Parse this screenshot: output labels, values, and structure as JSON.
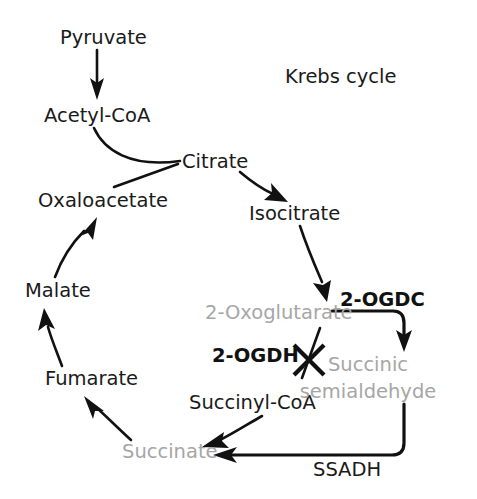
{
  "figure": {
    "title": "Krebs cycle",
    "title_position": {
      "x": 285,
      "y": 77
    },
    "background_color": "#ffffff",
    "colors": {
      "text": "#1a1a1a",
      "muted_text": "#a6a6a6",
      "arrow": "#111111"
    }
  },
  "nodes": [
    {
      "id": "pyruvate",
      "label": "Pyruvate",
      "x": 60,
      "y": 38,
      "style": "normal",
      "anchor": "start"
    },
    {
      "id": "acetyl_coa",
      "label": "Acetyl-CoA",
      "x": 44,
      "y": 116,
      "style": "normal",
      "anchor": "start"
    },
    {
      "id": "citrate",
      "label": "Citrate",
      "x": 182,
      "y": 162,
      "style": "normal",
      "anchor": "start"
    },
    {
      "id": "isocitrate",
      "label": "Isocitrate",
      "x": 249,
      "y": 214,
      "style": "normal",
      "anchor": "start"
    },
    {
      "id": "oxaloacetate",
      "label": "Oxaloacetate",
      "x": 38,
      "y": 201,
      "style": "normal",
      "anchor": "start"
    },
    {
      "id": "malate",
      "label": "Malate",
      "x": 25,
      "y": 291,
      "style": "normal",
      "anchor": "start"
    },
    {
      "id": "fumarate",
      "label": "Fumarate",
      "x": 45,
      "y": 379,
      "style": "normal",
      "anchor": "start"
    },
    {
      "id": "succinate",
      "label": "Succinate",
      "x": 122,
      "y": 452,
      "style": "muted",
      "anchor": "start"
    },
    {
      "id": "succinyl_coa",
      "label": "Succinyl-CoA",
      "x": 189,
      "y": 403,
      "style": "normal",
      "anchor": "start"
    },
    {
      "id": "oxoglutarate",
      "label": "2-Oxoglutarate",
      "x": 205,
      "y": 313,
      "style": "muted",
      "anchor": "start"
    },
    {
      "id": "succinic_1",
      "label": "Succinic",
      "x": 368,
      "y": 365,
      "style": "muted",
      "anchor": "middle"
    },
    {
      "id": "succinic_2",
      "label": "semialdehyde",
      "x": 368,
      "y": 392,
      "style": "muted",
      "anchor": "middle"
    }
  ],
  "enzymes": [
    {
      "id": "ogdc",
      "label": "2-OGDC",
      "x": 340,
      "y": 300,
      "style": "bold",
      "anchor": "start",
      "state": "active"
    },
    {
      "id": "ogdh",
      "label": "2-OGDH",
      "x": 212,
      "y": 356,
      "style": "bold",
      "anchor": "start",
      "state": "blocked"
    },
    {
      "id": "ssadh",
      "label": "SSADH",
      "x": 313,
      "y": 470,
      "style": "plain",
      "anchor": "start",
      "state": "active"
    }
  ],
  "edges": [
    {
      "id": "pyruvate-to-acetyl-coa",
      "from": "pyruvate",
      "to": "acetyl_coa",
      "arrowhead": true,
      "kind": "straight"
    },
    {
      "id": "acetyl-coa-to-citrate",
      "from": "acetyl_coa",
      "to": "citrate",
      "arrowhead": false,
      "kind": "curve"
    },
    {
      "id": "oxaloacetate-to-citrate",
      "from": "oxaloacetate",
      "to": "citrate",
      "arrowhead": false,
      "kind": "straight"
    },
    {
      "id": "citrate-to-isocitrate",
      "from": "citrate",
      "to": "isocitrate",
      "arrowhead": true,
      "kind": "curve"
    },
    {
      "id": "isocitrate-to-oxoglutarate",
      "from": "isocitrate",
      "to": "oxoglutarate",
      "arrowhead": true,
      "kind": "curve"
    },
    {
      "id": "oxoglutarate-to-succinic-semialdehyde",
      "from": "oxoglutarate",
      "to": "succinic_1",
      "arrowhead": true,
      "kind": "elbow",
      "enzyme": "ogdc"
    },
    {
      "id": "oxoglutarate-to-succinyl-coa",
      "from": "oxoglutarate",
      "to": "succinyl_coa",
      "arrowhead": false,
      "kind": "straight",
      "enzyme": "ogdh",
      "blocked": true
    },
    {
      "id": "succinic-semialdehyde-to-succinate",
      "from": "succinic_2",
      "to": "succinate",
      "arrowhead": true,
      "kind": "elbow",
      "enzyme": "ssadh"
    },
    {
      "id": "succinyl-coa-to-succinate",
      "from": "succinyl_coa",
      "to": "succinate",
      "arrowhead": true,
      "kind": "curve"
    },
    {
      "id": "succinate-to-fumarate",
      "from": "succinate",
      "to": "fumarate",
      "arrowhead": true,
      "kind": "curve"
    },
    {
      "id": "fumarate-to-malate",
      "from": "fumarate",
      "to": "malate",
      "arrowhead": true,
      "kind": "curve"
    },
    {
      "id": "malate-to-oxaloacetate",
      "from": "malate",
      "to": "oxaloacetate",
      "arrowhead": true,
      "kind": "curve"
    }
  ]
}
